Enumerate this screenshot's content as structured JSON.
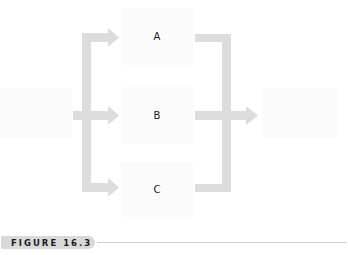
{
  "diagram": {
    "type": "flow",
    "colors": {
      "arrow": "#dcdcdc",
      "node_fill": "#fbfbfb",
      "caption_bg": "#d9d9d9",
      "caption_text": "#1a1a1a",
      "rule": "#cfcfcf"
    },
    "nodes": [
      {
        "id": "input",
        "label": ""
      },
      {
        "id": "A",
        "label": "A"
      },
      {
        "id": "B",
        "label": "B"
      },
      {
        "id": "C",
        "label": "C"
      },
      {
        "id": "output",
        "label": ""
      }
    ],
    "edges": [
      {
        "from": "input",
        "to": "A"
      },
      {
        "from": "input",
        "to": "B"
      },
      {
        "from": "input",
        "to": "C"
      },
      {
        "from": "A",
        "to": "output"
      },
      {
        "from": "B",
        "to": "output"
      },
      {
        "from": "C",
        "to": "output"
      }
    ]
  },
  "caption": {
    "label": "FIGURE 16.3"
  }
}
